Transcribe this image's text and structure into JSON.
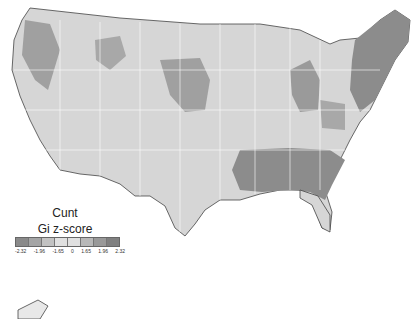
{
  "legend": {
    "title": "Cunt",
    "subtitle": "Gi z-score",
    "ticks": [
      "-2.32",
      "-1.96",
      "-1.65",
      "0",
      "1.65",
      "1.96",
      "2.32"
    ],
    "colors": [
      "#8a8a8a",
      "#a5a5a5",
      "#c2c2c2",
      "#e0e0e0",
      "#e0e0e0",
      "#b8b8b8",
      "#999999",
      "#808080"
    ]
  },
  "map": {
    "region": "Contiguous United States",
    "base_color": "#d9d9d9",
    "hotspot_color": "#8c8c8c",
    "border_color": "#ffffff"
  }
}
